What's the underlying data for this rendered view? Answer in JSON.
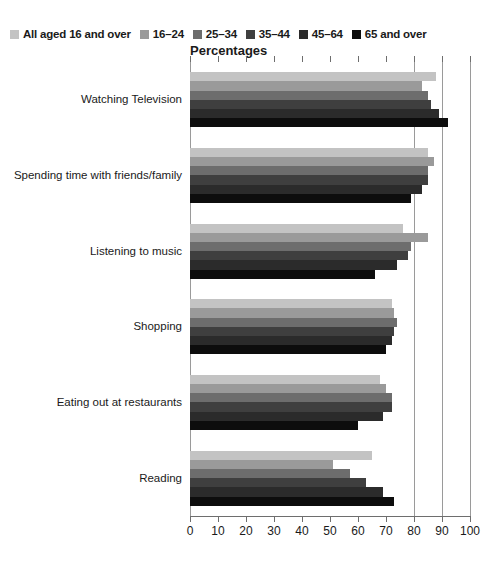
{
  "chart_data": {
    "type": "bar",
    "orientation": "horizontal",
    "title": "Percentages",
    "xlabel": "",
    "ylabel": "",
    "xlim": [
      0,
      100
    ],
    "xticks": [
      0,
      10,
      20,
      30,
      40,
      50,
      60,
      70,
      80,
      90,
      100
    ],
    "grid": "vertical gridlines at 80, 90 and 100",
    "gridlines": [
      80,
      90,
      100
    ],
    "legend_position": "top",
    "categories": [
      "Watching Television",
      "Spending time with friends/family",
      "Listening to music",
      "Shopping",
      "Eating out at restaurants",
      "Reading"
    ],
    "series": [
      {
        "name": "All aged 16 and over",
        "color": "#c3c3c3",
        "values": [
          88,
          85,
          76,
          72,
          68,
          65
        ]
      },
      {
        "name": "16–24",
        "color": "#9a9a9a",
        "values": [
          83,
          87,
          85,
          73,
          70,
          51
        ]
      },
      {
        "name": "25–34",
        "color": "#6d6d6d",
        "values": [
          85,
          85,
          79,
          74,
          72,
          57
        ]
      },
      {
        "name": "35–44",
        "color": "#3f3f3f",
        "values": [
          86,
          85,
          78,
          73,
          72,
          63
        ]
      },
      {
        "name": "45–64",
        "color": "#2b2b2b",
        "values": [
          89,
          83,
          74,
          72,
          69,
          69
        ]
      },
      {
        "name": "65 and over",
        "color": "#0d0d0d",
        "values": [
          92,
          79,
          66,
          70,
          60,
          73
        ]
      }
    ]
  },
  "legend": {
    "items": [
      {
        "label": "All aged 16 and over",
        "color": "#c3c3c3"
      },
      {
        "label": "16–24",
        "color": "#9a9a9a"
      },
      {
        "label": "25–34",
        "color": "#6d6d6d"
      },
      {
        "label": "35–44",
        "color": "#3f3f3f"
      },
      {
        "label": "45–64",
        "color": "#2b2b2b"
      },
      {
        "label": "65 and over",
        "color": "#0d0d0d"
      }
    ]
  },
  "axis": {
    "title": "Percentages",
    "tick_labels": [
      "0",
      "10",
      "20",
      "30",
      "40",
      "50",
      "60",
      "70",
      "80",
      "90",
      "100"
    ]
  },
  "category_labels": [
    "Watching Television",
    "Spending time with friends/family",
    "Listening to music",
    "Shopping",
    "Eating out at restaurants",
    "Reading"
  ]
}
